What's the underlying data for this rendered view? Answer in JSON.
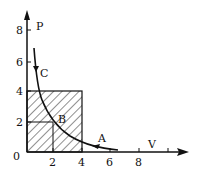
{
  "diagram": {
    "type": "P-V diagram",
    "axes": {
      "x": {
        "label": "V",
        "ticks": [
          "2",
          "4",
          "6",
          "8"
        ]
      },
      "y": {
        "label": "P",
        "ticks": [
          "2",
          "4",
          "6",
          "8"
        ]
      },
      "origin": "0"
    },
    "points": [
      {
        "label": "A",
        "V": 5.2,
        "P": 1.3
      },
      {
        "label": "B",
        "V": 2,
        "P": 2
      },
      {
        "label": "C",
        "V": 1,
        "P": 4
      }
    ],
    "curve": "P·V = const (hyperbola)",
    "shaded_regions": [
      {
        "name": "rectangle V0-4 P0-4"
      },
      {
        "name": "rectangle V0-2 P0-2"
      }
    ],
    "colors": {
      "ink": "#111111",
      "background": "#ffffff"
    }
  }
}
